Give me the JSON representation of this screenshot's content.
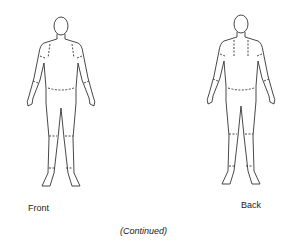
{
  "figures": [
    {
      "view": "front",
      "label": "Front"
    },
    {
      "view": "back",
      "label": "Back"
    }
  ],
  "footer": "(Continued)"
}
